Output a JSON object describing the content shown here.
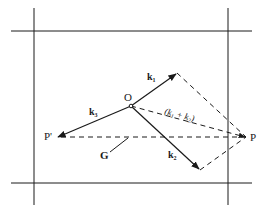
{
  "diagram": {
    "type": "vector-construction",
    "colors": {
      "ink": "#1a1a1a",
      "background": "#ffffff"
    },
    "grid_lines": {
      "horizontal": [
        31,
        183
      ],
      "vertical": [
        34,
        228
      ]
    },
    "points": {
      "O": {
        "label": "O",
        "x": 131,
        "y": 106
      },
      "P": {
        "label": "P",
        "x": 246,
        "y": 137
      },
      "P_prime": {
        "label": "P'",
        "x": 57,
        "y": 137
      },
      "k1_tip": {
        "x": 177,
        "y": 73
      },
      "k2_tip": {
        "x": 200,
        "y": 170
      }
    },
    "vectors": [
      {
        "id": "k1",
        "label": "k",
        "subscript": "1",
        "style": "solid-arrow"
      },
      {
        "id": "k2",
        "label": "k",
        "subscript": "2",
        "style": "solid-arrow"
      },
      {
        "id": "k3",
        "label": "k",
        "subscript": "3",
        "style": "solid-arrow"
      },
      {
        "id": "sum",
        "label": "(k",
        "sub1": "1",
        "plus": " + k",
        "sub2": "2",
        "close": ")",
        "style": "dashed"
      },
      {
        "id": "G",
        "label": "G",
        "style": "dashed"
      }
    ],
    "labels": {
      "O": "O",
      "P": "P",
      "P_prime": "P'",
      "G": "G",
      "k1": "k",
      "k1_sub": "1",
      "k2": "k",
      "k2_sub": "2",
      "k3": "k",
      "k3_sub": "3",
      "sum_open": "(k",
      "sum_sub1": "1",
      "sum_plus": " + k",
      "sum_sub2": "2",
      "sum_close": ")"
    }
  }
}
